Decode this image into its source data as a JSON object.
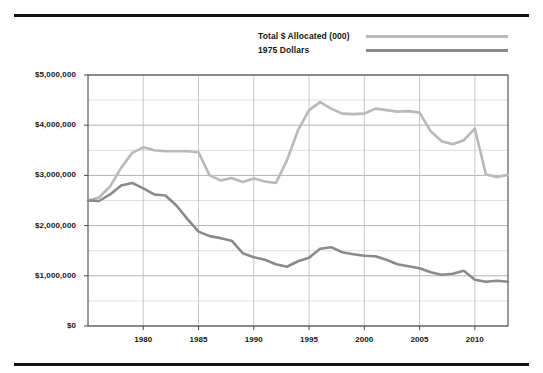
{
  "legend": {
    "entries": [
      {
        "label": "Total $ Allocated (000)",
        "color": "#b9b9b9",
        "series_key": "total_allocated"
      },
      {
        "label": "1975 Dollars",
        "color": "#8a8a8a",
        "series_key": "dollars_1975"
      }
    ]
  },
  "chart_data": {
    "type": "line",
    "title": "",
    "subtitle": "",
    "xlabel": "",
    "ylabel": "",
    "grid": true,
    "legend_position": "top",
    "xlim": [
      1975,
      2013
    ],
    "ylim": [
      0,
      5000000
    ],
    "ytick_labels": [
      "$0",
      "$1,000,000",
      "$2,000,000",
      "$3,000,000",
      "$4,000,000",
      "$5,000,000"
    ],
    "ytick_values": [
      0,
      1000000,
      2000000,
      3000000,
      4000000,
      5000000
    ],
    "ytick_minor_step": 500000,
    "xtick_labels": [
      "1980",
      "1985",
      "1990",
      "1995",
      "2000",
      "2005",
      "2010"
    ],
    "xtick_values": [
      1980,
      1985,
      1990,
      1995,
      2000,
      2005,
      2010
    ],
    "x": [
      1975,
      1976,
      1977,
      1978,
      1979,
      1980,
      1981,
      1982,
      1983,
      1984,
      1985,
      1986,
      1987,
      1988,
      1989,
      1990,
      1991,
      1992,
      1993,
      1994,
      1995,
      1996,
      1997,
      1998,
      1999,
      2000,
      2001,
      2002,
      2003,
      2004,
      2005,
      2006,
      2007,
      2008,
      2009,
      2010,
      2011,
      2012,
      2013
    ],
    "series": [
      {
        "name": "Total $ Allocated (000)",
        "color": "#b9b9b9",
        "values": [
          2500000,
          2560000,
          2780000,
          3150000,
          3450000,
          3560000,
          3500000,
          3480000,
          3480000,
          3480000,
          3460000,
          3000000,
          2900000,
          2950000,
          2870000,
          2940000,
          2880000,
          2850000,
          3300000,
          3900000,
          4300000,
          4460000,
          4330000,
          4230000,
          4220000,
          4230000,
          4330000,
          4300000,
          4270000,
          4280000,
          4250000,
          3880000,
          3680000,
          3620000,
          3700000,
          3930000,
          3020000,
          2970000,
          3010000
        ]
      },
      {
        "name": "1975 Dollars",
        "color": "#8a8a8a",
        "values": [
          2500000,
          2490000,
          2620000,
          2800000,
          2850000,
          2740000,
          2620000,
          2600000,
          2400000,
          2130000,
          1880000,
          1790000,
          1750000,
          1700000,
          1450000,
          1370000,
          1320000,
          1230000,
          1180000,
          1290000,
          1360000,
          1540000,
          1570000,
          1470000,
          1430000,
          1400000,
          1390000,
          1320000,
          1230000,
          1190000,
          1150000,
          1070000,
          1020000,
          1040000,
          1100000,
          920000,
          880000,
          900000,
          880000
        ]
      }
    ]
  }
}
